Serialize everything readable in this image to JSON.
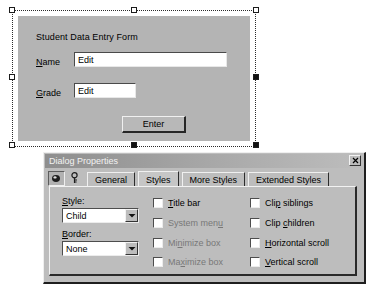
{
  "designer": {
    "form_title": "Student Data Entry Form",
    "fields": [
      {
        "label_prefix": "N",
        "label_rest": "ame",
        "value": "Edit"
      },
      {
        "label_prefix": "G",
        "label_rest": "rade",
        "value": "Edit"
      }
    ],
    "button_label": "Enter",
    "handles": [
      {
        "name": "top-left",
        "state": "hollow"
      },
      {
        "name": "top-middle",
        "state": "hollow"
      },
      {
        "name": "top-right",
        "state": "hollow"
      },
      {
        "name": "middle-left",
        "state": "hollow"
      },
      {
        "name": "middle-right",
        "state": "filled"
      },
      {
        "name": "bottom-left",
        "state": "hollow"
      },
      {
        "name": "bottom-middle",
        "state": "filled"
      },
      {
        "name": "bottom-right",
        "state": "filled"
      }
    ]
  },
  "properties_window": {
    "title": "Dialog Properties",
    "close_label": "x",
    "toolbar": [
      {
        "name": "pushpin-icon",
        "pressed": true
      },
      {
        "name": "key-icon",
        "pressed": false
      }
    ],
    "tabs": [
      {
        "label": "General",
        "selected": false
      },
      {
        "label": "Styles",
        "selected": true
      },
      {
        "label": "More Styles",
        "selected": false
      },
      {
        "label": "Extended Styles",
        "selected": false
      }
    ],
    "combos": [
      {
        "label_prefix": "S",
        "label_rest": "tyle:",
        "value": "Child"
      },
      {
        "label_prefix": "B",
        "label_rest": "order:",
        "value": "None"
      }
    ],
    "checkboxes_middle": [
      {
        "pre": "",
        "acc": "T",
        "post": "itle bar",
        "checked": false,
        "enabled": true
      },
      {
        "pre": "System men",
        "acc": "u",
        "post": "",
        "checked": false,
        "enabled": false
      },
      {
        "pre": "Mi",
        "acc": "n",
        "post": "imize box",
        "checked": false,
        "enabled": false
      },
      {
        "pre": "Ma",
        "acc": "x",
        "post": "imize box",
        "checked": false,
        "enabled": false
      }
    ],
    "checkboxes_right": [
      {
        "pre": "Cli",
        "acc": "p",
        "post": " siblings",
        "checked": false,
        "enabled": true
      },
      {
        "pre": "Clip ",
        "acc": "c",
        "post": "hildren",
        "checked": false,
        "enabled": true
      },
      {
        "pre": "",
        "acc": "H",
        "post": "orizontal scroll",
        "checked": false,
        "enabled": true
      },
      {
        "pre": "",
        "acc": "V",
        "post": "ertical scroll",
        "checked": false,
        "enabled": true
      }
    ]
  },
  "colors": {
    "face": "#bdbdbd",
    "form_surface": "#b4b4b4",
    "titlebar": "#8e8e8e",
    "text": "#000000",
    "text_disabled": "#787878"
  }
}
